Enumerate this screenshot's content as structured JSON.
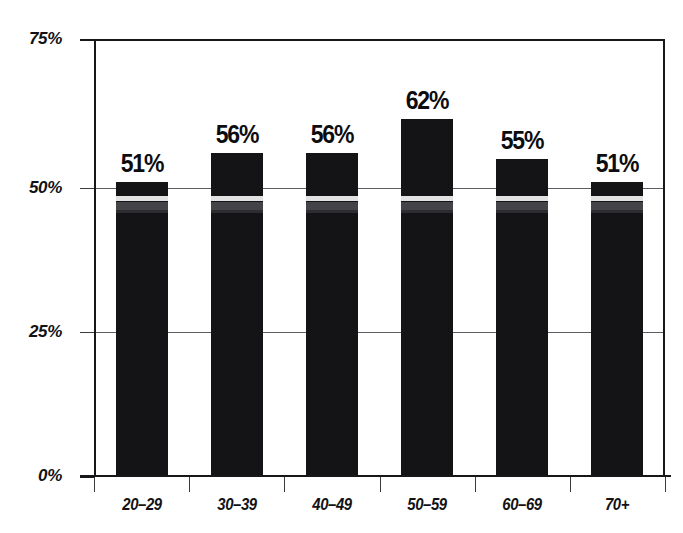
{
  "chart_data": {
    "type": "bar",
    "title": "",
    "subtitle": "",
    "xlabel": "",
    "ylabel": "",
    "categories": [
      "20–29",
      "30–39",
      "40–49",
      "50–59",
      "60–69",
      "70+"
    ],
    "values": [
      51,
      56,
      56,
      62,
      55,
      51
    ],
    "value_labels": [
      "51%",
      "56%",
      "56%",
      "62%",
      "55%",
      "51%"
    ],
    "ylim": [
      0,
      75
    ],
    "ytick_values": [
      0,
      25,
      50,
      75
    ],
    "ytick_labels": [
      "0%",
      "25%",
      "50%",
      "75%"
    ],
    "grid": true,
    "legend": null,
    "series": [
      {
        "name": "",
        "values": [
          51,
          56,
          56,
          62,
          55,
          51
        ]
      }
    ],
    "colors": {
      "bar": "#141417",
      "axis": "#17171a",
      "gridline": "#5d5d62",
      "text": "#121215",
      "background": "#ffffff"
    }
  }
}
